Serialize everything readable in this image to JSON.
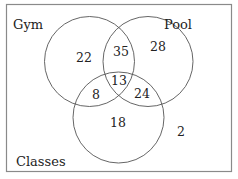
{
  "diagram": {
    "type": "venn",
    "sets": [
      {
        "name": "Gym",
        "label": "Gym"
      },
      {
        "name": "Pool",
        "label": "Pool"
      },
      {
        "name": "Classes",
        "label": "Classes"
      }
    ],
    "regions": {
      "gym_only": "22",
      "pool_only": "28",
      "classes_only": "18",
      "gym_pool_only": "35",
      "gym_classes_only": "8",
      "pool_classes_only": "24",
      "all_three": "13",
      "none": "2"
    },
    "colors": {
      "stroke": "#555555",
      "frame": "#888888",
      "text": "#222222",
      "background": "#ffffff"
    }
  }
}
